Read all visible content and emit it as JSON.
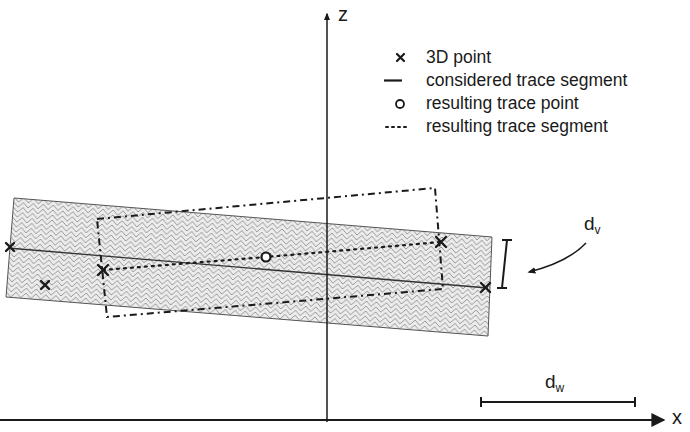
{
  "diagram": {
    "axes": {
      "x_label": "x",
      "z_label": "z"
    },
    "legend": [
      {
        "symbol": "cross",
        "label": "3D point"
      },
      {
        "symbol": "solid-line",
        "label": "considered trace segment"
      },
      {
        "symbol": "circle",
        "label": "resulting trace point"
      },
      {
        "symbol": "dotted-line",
        "label": "resulting trace segment"
      }
    ],
    "annotations": {
      "dv_main": "d",
      "dv_sub": "v",
      "dw_main": "d",
      "dw_sub": "w"
    },
    "colors": {
      "ink": "#1a1a1a",
      "hatch": "#9a9a9a",
      "band_fill": "#e6e6e6",
      "background": "#ffffff"
    }
  }
}
